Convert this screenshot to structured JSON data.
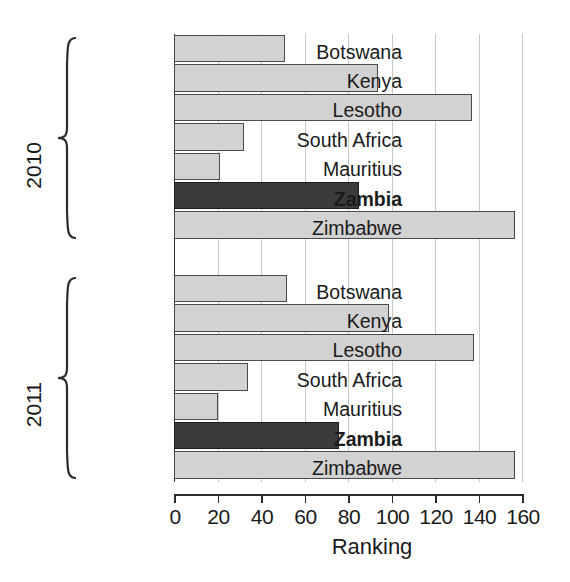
{
  "chart_data": {
    "type": "bar",
    "orientation": "horizontal",
    "title": "",
    "xlabel": "Ranking",
    "ylabel": "",
    "xlim": [
      0,
      160
    ],
    "xticks": [
      0,
      20,
      40,
      60,
      80,
      100,
      120,
      140,
      160
    ],
    "xtick_labels": [
      "0",
      "20",
      "40",
      "60",
      "80",
      "100",
      "120",
      "140",
      "160"
    ],
    "grid": "vertical",
    "legend": "none",
    "highlight_category": "Zambia",
    "colors": {
      "bar": "#d2d2d2",
      "bar_border": "#4a4a4a",
      "highlight_bar": "#3b3b3b",
      "highlight_border": "#1c1c1c",
      "gridline": "#c9c9c9",
      "axis": "#2b2b2b",
      "text": "#1a1a1a",
      "background": "#ffffff"
    },
    "groups": [
      {
        "label": "2010",
        "categories": [
          "Botswana",
          "Kenya",
          "Lesotho",
          "South Africa",
          "Mauritius",
          "Zambia",
          "Zimbabwe"
        ],
        "values": [
          51,
          94,
          137,
          32,
          21,
          85,
          157
        ]
      },
      {
        "label": "2011",
        "categories": [
          "Botswana",
          "Kenya",
          "Lesotho",
          "South Africa",
          "Mauritius",
          "Zambia",
          "Zimbabwe"
        ],
        "values": [
          52,
          99,
          138,
          34,
          20,
          76,
          157
        ]
      }
    ]
  }
}
